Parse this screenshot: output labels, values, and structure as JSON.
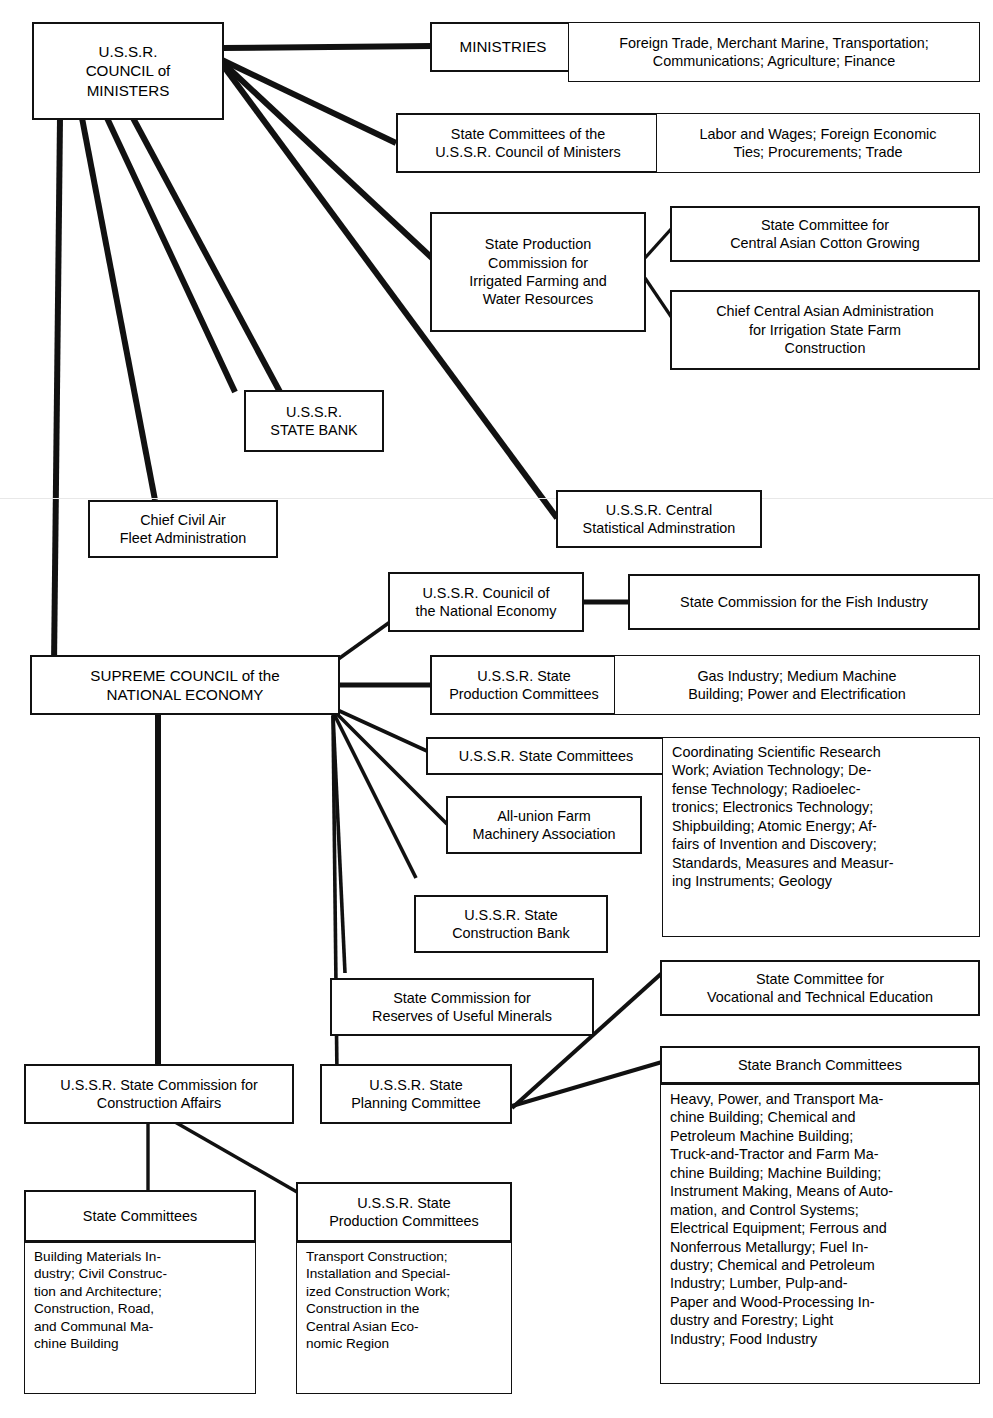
{
  "diagram": {
    "type": "organizational-chart",
    "background_color": "#ffffff",
    "line_color": "#111111"
  },
  "nodes": {
    "council_of_ministers": "U.S.S.R.\nCOUNCIL of\nMINISTERS",
    "ministries": "MINISTRIES",
    "ministries_list": "Foreign Trade, Merchant Marine, Transportation;\nCommunications; Agriculture; Finance",
    "state_committees_com": "State Committees of the\nU.S.S.R. Council of Ministers",
    "state_committees_com_list": "Labor and Wages; Foreign Economic\nTies; Procurements; Trade",
    "state_production_commission": "State Production\nCommission for\nIrrigated Farming and\nWater Resources",
    "cotton_growing": "State Committee for\nCentral Asian Cotton Growing",
    "irrigation_admin": "Chief Central Asian Administration\nfor Irrigation State Farm\nConstruction",
    "state_bank": "U.S.S.R.\nSTATE BANK",
    "civil_air": "Chief Civil Air\nFleet Administration",
    "central_statistical": "U.S.S.R. Central\nStatistical Adminstration",
    "council_national_economy": "U.S.S.R. Counicil of\nthe National Economy",
    "fish_industry": "State Commission for the Fish Industry",
    "supreme_council": "SUPREME COUNCIL of the\nNATIONAL ECONOMY",
    "state_production_committees": "U.S.S.R. State\nProduction Committees",
    "state_production_committees_list": "Gas Industry; Medium Machine\nBuilding; Power and Electrification",
    "state_committees_ussr": "U.S.S.R. State Committees",
    "state_committees_ussr_list": "Coordinating Scientific Research\nWork; Aviation Technology; De-\nfense Technology; Radioelec-\ntronics; Electronics Technology;\nShipbuilding; Atomic Energy; Af-\nfairs of Invention and Discovery;\nStandards, Measures and Measur-\ning Instruments; Geology",
    "farm_machinery": "All-union Farm\nMachinery Association",
    "state_construction_bank": "U.S.S.R. State\nConstruction Bank",
    "reserves_minerals": "State Commission for\nReserves of Useful Minerals",
    "state_planning_committee": "U.S.S.R. State\nPlanning Committee",
    "vocational_education": "State Committee for\nVocational and Technical Education",
    "state_branch_committees": "State Branch Committees",
    "state_branch_committees_list": "Heavy, Power, and Transport Ma-\nchine Building; Chemical and\nPetroleum Machine Building;\nTruck-and-Tractor and Farm Ma-\nchine Building; Machine Building;\nInstrument Making, Means of Auto-\nmation, and Control Systems;\nElectrical Equipment; Ferrous and\nNonferrous Metallurgy; Fuel In-\ndustry; Chemical and Petroleum\nIndustry; Lumber, Pulp-and-\nPaper and Wood-Processing In-\ndustry and Forestry; Light\nIndustry; Food Industry",
    "construction_affairs": "U.S.S.R. State Commission for\nConstruction Affairs",
    "construction_state_committees": "State Committees",
    "construction_state_committees_list": "Building Materials In-\ndustry; Civil Construc-\ntion and Architecture;\nConstruction, Road,\nand Communal Ma-\nchine Building",
    "construction_production_committees": "U.S.S.R. State\nProduction Committees",
    "construction_production_committees_list": "Transport Construction;\nInstallation and Special-\nized Construction Work;\nConstruction in the\nCentral Asian Eco-\nnomic Region"
  }
}
